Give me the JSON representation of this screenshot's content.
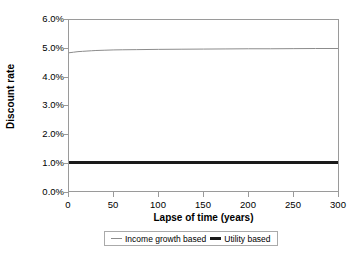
{
  "chart_data": {
    "type": "line",
    "title": "",
    "xlabel": "Lapse of time (years)",
    "ylabel": "Discount rate",
    "xlim": [
      0,
      300
    ],
    "ylim": [
      0,
      0.06
    ],
    "grid": false,
    "legend_position": "bottom",
    "x_ticks": [
      "0",
      "50",
      "100",
      "150",
      "200",
      "250",
      "300"
    ],
    "x_tick_values": [
      0,
      50,
      100,
      150,
      200,
      250,
      300
    ],
    "y_ticks": [
      "0.0%",
      "1.0%",
      "2.0%",
      "3.0%",
      "4.0%",
      "5.0%",
      "6.0%"
    ],
    "y_tick_values": [
      0.0,
      1.0,
      2.0,
      3.0,
      4.0,
      5.0,
      6.0
    ],
    "x": [
      0,
      5,
      10,
      15,
      20,
      25,
      30,
      40,
      50,
      60,
      75,
      100,
      125,
      150,
      175,
      200,
      225,
      250,
      275,
      300
    ],
    "series": [
      {
        "name": "Income growth based",
        "color": "#8c8c8c",
        "width": 1,
        "values": [
          4.85,
          4.87,
          4.89,
          4.9,
          4.91,
          4.92,
          4.93,
          4.94,
          4.95,
          4.955,
          4.96,
          4.97,
          4.975,
          4.98,
          4.985,
          4.99,
          4.99,
          4.995,
          5.0,
          5.0
        ]
      },
      {
        "name": "Utility based",
        "color": "#1a1a1a",
        "width": 3,
        "values": [
          1.0,
          1.0,
          1.0,
          1.0,
          1.0,
          1.0,
          1.0,
          1.0,
          1.0,
          1.0,
          1.0,
          1.0,
          1.0,
          1.0,
          1.0,
          1.0,
          1.0,
          1.0,
          1.0,
          1.0
        ]
      }
    ],
    "colors": {
      "income_growth_based": "#8c8c8c",
      "utility_based": "#1a1a1a",
      "axis": "#9a9a9a",
      "plot_background": "#ffffff",
      "text": "#000000"
    }
  },
  "legend": {
    "entries": [
      {
        "label": "Income growth based"
      },
      {
        "label": "Utility based"
      }
    ]
  }
}
